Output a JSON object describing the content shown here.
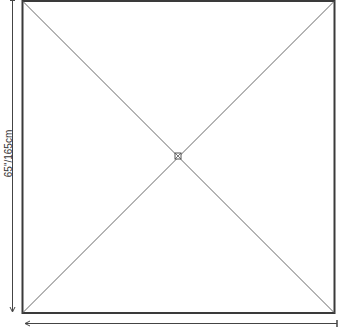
{
  "diagram": {
    "shape": "square",
    "dimension_label": "65\"/165cm",
    "colors": {
      "frame": "#3a3a3a",
      "diagonals": "#6a6a6a",
      "dimension": "#444444",
      "background": "#ffffff"
    },
    "elements": [
      "outer-frame",
      "diagonal-lines",
      "center-marker",
      "vertical-dimension-arrow",
      "horizontal-dimension-arrow"
    ]
  }
}
